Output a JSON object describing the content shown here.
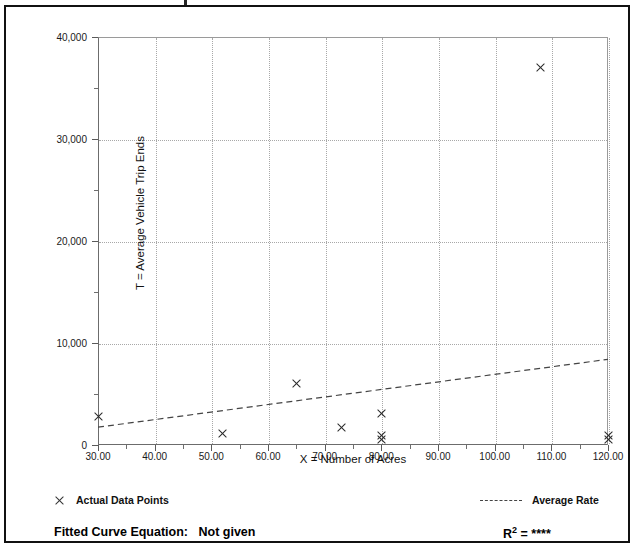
{
  "chart_data": {
    "type": "scatter",
    "title": "",
    "xlabel": "X = Number of Acres",
    "ylabel": "T = Average Vehicle Trip Ends",
    "xlim": [
      30,
      120
    ],
    "ylim": [
      0,
      40000
    ],
    "xticks": [
      "30.00",
      "40.00",
      "50.00",
      "60.00",
      "70.00",
      "80.00",
      "90.00",
      "100.00",
      "110.00",
      "120.00"
    ],
    "xtick_values": [
      30,
      40,
      50,
      60,
      70,
      80,
      90,
      100,
      110,
      120
    ],
    "yticks": [
      "0",
      "10,000",
      "20,000",
      "30,000",
      "40,000"
    ],
    "ytick_values": [
      0,
      10000,
      20000,
      30000,
      40000
    ],
    "grid": true,
    "legend_position": "below-plot",
    "series": [
      {
        "name": "Actual Data Points",
        "type": "scatter",
        "marker": "x",
        "color": "#2a2a2a",
        "points": [
          {
            "x": 30.0,
            "y": 2800
          },
          {
            "x": 52.0,
            "y": 1150
          },
          {
            "x": 65.0,
            "y": 6000
          },
          {
            "x": 73.0,
            "y": 1750
          },
          {
            "x": 80.0,
            "y": 3050
          },
          {
            "x": 80.0,
            "y": 900
          },
          {
            "x": 80.0,
            "y": 500
          },
          {
            "x": 108.0,
            "y": 37000
          },
          {
            "x": 120.0,
            "y": 950
          },
          {
            "x": 120.0,
            "y": 500
          }
        ]
      },
      {
        "name": "Average Rate",
        "type": "line",
        "style": "dashed",
        "color": "#444444",
        "endpoints": [
          {
            "x": 30.0,
            "y": 1750
          },
          {
            "x": 120.0,
            "y": 8400
          }
        ]
      }
    ]
  },
  "legend": {
    "data_points_label": "Actual Data Points",
    "average_rate_label": "Average Rate",
    "marker_icon": "x-marker-icon",
    "line_icon": "dashed-line-icon"
  },
  "footer": {
    "equation_label": "Fitted Curve Equation:",
    "equation_value": "Not given",
    "rsq_symbol": "R",
    "rsq_exponent": "2",
    "rsq_equals": " = ",
    "rsq_value": "****"
  }
}
